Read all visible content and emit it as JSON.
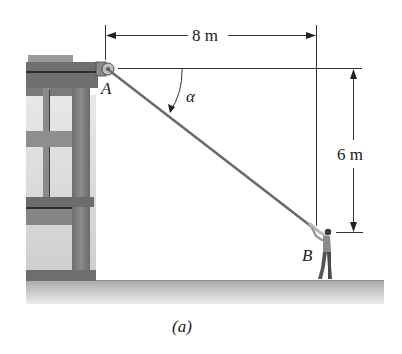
{
  "figure": {
    "caption": "(a)",
    "points": {
      "A": "A",
      "B": "B"
    },
    "angle_label": "α",
    "dimensions": {
      "horizontal": "8 m",
      "vertical": "6 m"
    }
  },
  "colors": {
    "building_dark": "#5f5f5f",
    "building_mid": "#8a8a8a",
    "building_light": "#d6d6d6",
    "ground": "#c8c8c8",
    "rope": "#6b6b6b",
    "lines": "#333333"
  }
}
